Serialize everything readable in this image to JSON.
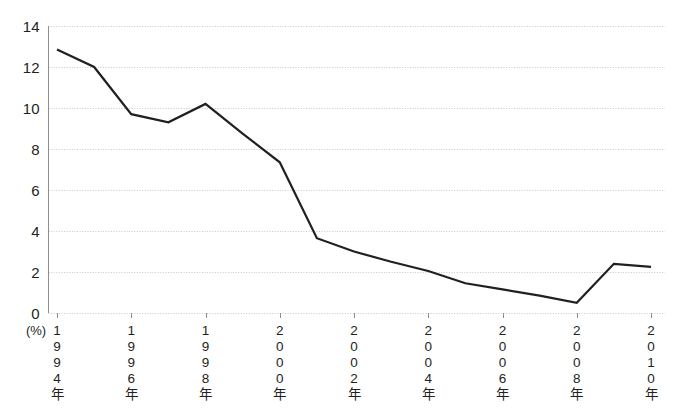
{
  "chart_data": {
    "type": "line",
    "title": "",
    "xlabel": "",
    "ylabel": "",
    "unit_label": "(%)",
    "ylim": [
      0,
      14
    ],
    "ytick_values": [
      0,
      2,
      4,
      6,
      8,
      10,
      12,
      14
    ],
    "ytick_labels": [
      "0",
      "2",
      "4",
      "6",
      "8",
      "10",
      "12",
      "14"
    ],
    "grid": true,
    "grid_axis": "y",
    "legend": "none",
    "line_color": "#231f20",
    "grid_color": "#c9c9c9",
    "axis_color": "#8d8d8d",
    "x": [
      1994,
      1995,
      1996,
      1997,
      1998,
      1999,
      2000,
      2001,
      2002,
      2003,
      2004,
      2005,
      2006,
      2007,
      2008,
      2009,
      2010
    ],
    "categories": [
      "1994",
      "1995",
      "1996",
      "1997",
      "1998",
      "1999",
      "2000",
      "2001",
      "2002",
      "2003",
      "2004",
      "2005",
      "2006",
      "2007",
      "2008",
      "2009",
      "2010"
    ],
    "values": [
      12.85,
      12.0,
      9.7,
      9.3,
      10.2,
      8.75,
      7.35,
      3.65,
      3.0,
      2.5,
      2.05,
      1.45,
      1.15,
      0.85,
      0.5,
      2.4,
      2.25
    ],
    "xtick_positions": [
      1994,
      1996,
      1998,
      2000,
      2002,
      2004,
      2006,
      2008,
      2010
    ],
    "xtick_labels": [
      "1994年",
      "1996年",
      "1998年",
      "2000年",
      "2002年",
      "2004年",
      "2006年",
      "2008年",
      "2010年"
    ],
    "xtick_orientation": "vertical-characters",
    "xlim": [
      1994,
      2010
    ]
  }
}
